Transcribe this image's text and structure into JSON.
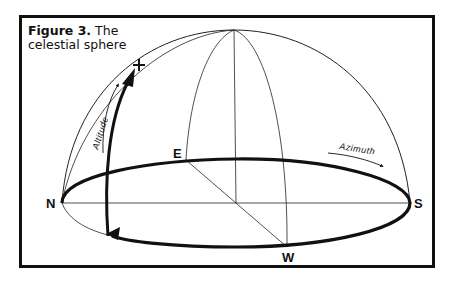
{
  "figure": {
    "label": "Figure 3.",
    "title_line1": "The",
    "title_line2": "celestial sphere"
  },
  "labels": {
    "north": "N",
    "south": "S",
    "east": "E",
    "west": "W",
    "altitude": "Altitude",
    "azimuth": "Azimuth",
    "star_marker": "+"
  }
}
